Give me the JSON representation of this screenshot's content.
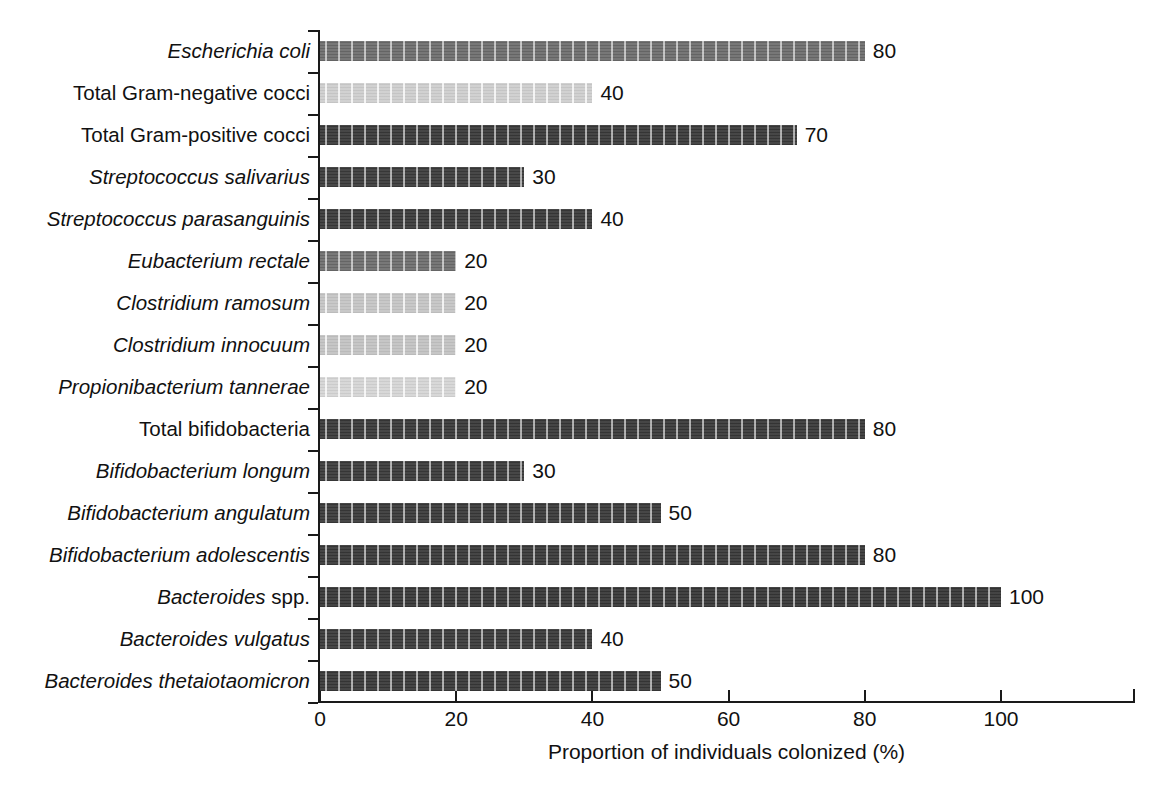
{
  "chart_data": {
    "type": "bar",
    "orientation": "horizontal",
    "title": "",
    "xlabel": "Proportion of individuals colonized (%)",
    "ylabel": "",
    "xlim": [
      0,
      120
    ],
    "xticks": [
      0,
      20,
      40,
      60,
      80,
      100
    ],
    "xtick_labels": [
      "0",
      "20",
      "40",
      "60",
      "80",
      "100"
    ],
    "grid": false,
    "legend": null,
    "categories": [
      "Escherichia coli",
      "Total Gram-negative cocci",
      "Total Gram-positive cocci",
      "Streptococcus salivarius",
      "Streptococcus parasanguinis",
      "Eubacterium rectale",
      "Clostridium ramosum",
      "Clostridium innocuum",
      "Propionibacterium tannerae",
      "Total bifidobacteria",
      "Bifidobacterium longum",
      "Bifidobacterium angulatum",
      "Bifidobacterium adolescentis",
      "Bacteroides spp.",
      "Bacteroides vulgatus",
      "Bacteroides thetaiotaomicron"
    ],
    "values": [
      80,
      40,
      70,
      30,
      40,
      20,
      20,
      20,
      20,
      80,
      30,
      50,
      80,
      100,
      40,
      50
    ],
    "value_labels": [
      "80",
      "40",
      "70",
      "30",
      "40",
      "20",
      "20",
      "20",
      "20",
      "80",
      "30",
      "50",
      "80",
      "100",
      "40",
      "50"
    ],
    "bar_colors": [
      "#6f6f6f",
      "#cfcfcf",
      "#3b3b3b",
      "#3d3d3d",
      "#3b3b3b",
      "#707070",
      "#c6c6c6",
      "#c4c4c4",
      "#d6d6d6",
      "#3a3a3a",
      "#3c3c3c",
      "#3b3b3b",
      "#3a3a3a",
      "#383838",
      "#3b3b3b",
      "#3a3a3a"
    ]
  },
  "rows": [
    {
      "label_italic": "Escherichia coli",
      "label_roman": "",
      "value": 80,
      "value_label": "80",
      "color": "#6f6f6f",
      "light": false
    },
    {
      "label_italic": "",
      "label_roman": "Total Gram-negative cocci",
      "value": 40,
      "value_label": "40",
      "color": "#cfcfcf",
      "light": true
    },
    {
      "label_italic": "",
      "label_roman": "Total Gram-positive cocci",
      "value": 70,
      "value_label": "70",
      "color": "#3b3b3b",
      "light": false
    },
    {
      "label_italic": "Streptococcus salivarius",
      "label_roman": "",
      "value": 30,
      "value_label": "30",
      "color": "#3d3d3d",
      "light": false
    },
    {
      "label_italic": "Streptococcus parasanguinis",
      "label_roman": "",
      "value": 40,
      "value_label": "40",
      "color": "#3b3b3b",
      "light": false
    },
    {
      "label_italic": "Eubacterium rectale",
      "label_roman": "",
      "value": 20,
      "value_label": "20",
      "color": "#707070",
      "light": false
    },
    {
      "label_italic": "Clostridium ramosum",
      "label_roman": "",
      "value": 20,
      "value_label": "20",
      "color": "#c6c6c6",
      "light": true
    },
    {
      "label_italic": "Clostridium innocuum",
      "label_roman": "",
      "value": 20,
      "value_label": "20",
      "color": "#c4c4c4",
      "light": true
    },
    {
      "label_italic": "Propionibacterium tannerae",
      "label_roman": "",
      "value": 20,
      "value_label": "20",
      "color": "#d6d6d6",
      "light": true
    },
    {
      "label_italic": "",
      "label_roman": "Total bifidobacteria",
      "value": 80,
      "value_label": "80",
      "color": "#3a3a3a",
      "light": false
    },
    {
      "label_italic": "Bifidobacterium longum",
      "label_roman": "",
      "value": 30,
      "value_label": "30",
      "color": "#3c3c3c",
      "light": false
    },
    {
      "label_italic": "Bifidobacterium angulatum",
      "label_roman": "",
      "value": 50,
      "value_label": "50",
      "color": "#3b3b3b",
      "light": false
    },
    {
      "label_italic": "Bifidobacterium adolescentis",
      "label_roman": "",
      "value": 80,
      "value_label": "80",
      "color": "#3a3a3a",
      "light": false
    },
    {
      "label_italic": "Bacteroides",
      "label_roman": " spp.",
      "value": 100,
      "value_label": "100",
      "color": "#383838",
      "light": false
    },
    {
      "label_italic": "Bacteroides vulgatus",
      "label_roman": "",
      "value": 40,
      "value_label": "40",
      "color": "#3b3b3b",
      "light": false
    },
    {
      "label_italic": "Bacteroides thetaiotaomicron",
      "label_roman": "",
      "value": 50,
      "value_label": "50",
      "color": "#3a3a3a",
      "light": false
    }
  ],
  "axis": {
    "x_title": "Proportion of individuals colonized (%)",
    "x_tick_labels": [
      "0",
      "20",
      "40",
      "60",
      "80",
      "100"
    ]
  }
}
